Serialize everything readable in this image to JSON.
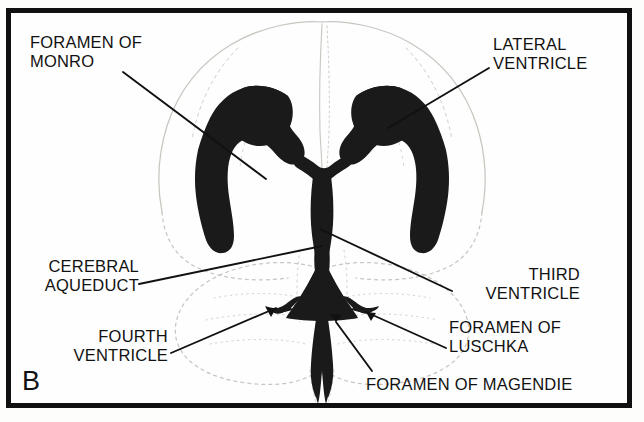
{
  "figure": {
    "panel_letter": "B",
    "frame_color": "#101010",
    "ventricle_fill": "#1a1a1a",
    "brain_outline_color": "#c9c6c0",
    "background": "#fefefe"
  },
  "labels": {
    "foramen_of_monro": "FORAMEN OF\nMONRO",
    "lateral_ventricle": "LATERAL\nVENTRICLE",
    "cerebral_aqueduct": "CEREBRAL\nAQUEDUCT",
    "third_ventricle": "THIRD\nVENTRICLE",
    "fourth_ventricle": "FOURTH\nVENTRICLE",
    "foramen_of_luschka": "FORAMEN OF\nLUSCHKA",
    "foramen_of_magendie": "FORAMEN OF MAGENDIE"
  },
  "leaders": [
    {
      "name": "leader-foramen-of-monro",
      "from": [
        123,
        72
      ],
      "to": [
        266,
        179
      ],
      "arrow": false
    },
    {
      "name": "leader-lateral-ventricle",
      "from": [
        489,
        68
      ],
      "to": [
        388,
        128
      ],
      "arrow": false
    },
    {
      "name": "leader-cerebral-aqueduct",
      "from": [
        139,
        284
      ],
      "to": [
        322,
        246
      ],
      "arrow": false
    },
    {
      "name": "leader-third-ventricle",
      "from": [
        452,
        291
      ],
      "to": [
        320,
        229
      ],
      "arrow": false
    },
    {
      "name": "leader-fourth-ventricle",
      "from": [
        171,
        353
      ],
      "to": [
        276,
        308
      ],
      "arrow": true
    },
    {
      "name": "leader-foramen-of-luschka",
      "from": [
        446,
        348
      ],
      "to": [
        366,
        312
      ],
      "arrow": true
    },
    {
      "name": "leader-foramen-of-magendie",
      "from": [
        372,
        371
      ],
      "to": [
        336,
        322
      ],
      "arrow": true
    }
  ]
}
